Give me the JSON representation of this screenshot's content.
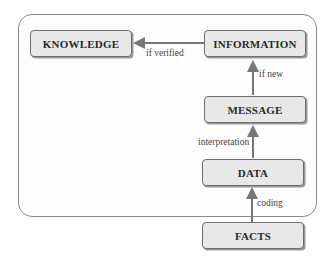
{
  "diagram": {
    "nodes": {
      "knowledge": "KNOWLEDGE",
      "information": "INFORMATION",
      "message": "MESSAGE",
      "data": "DATA",
      "facts": "FACTS"
    },
    "edges": {
      "information_to_knowledge": "if verified",
      "message_to_information": "if new",
      "data_to_message": "interpretation",
      "facts_to_data": "coding"
    },
    "colors": {
      "node_fill": "#e8e8e8",
      "node_border": "#6e6e6e",
      "arrow": "#777777",
      "frame": "#8a8a8a"
    }
  }
}
